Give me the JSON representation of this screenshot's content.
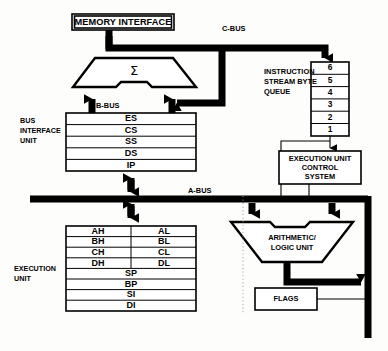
{
  "diagram": {
    "background_color": "#fdfdfb",
    "line_color": "#000000"
  },
  "blocks": {
    "memory_interface": {
      "label": "MEMORY INTERFACE"
    },
    "adder": {
      "label": "Σ",
      "name": "address-adder"
    },
    "instruction_queue": {
      "label_line1": "INSTRUCTION",
      "label_line2": "STREAM BYTE",
      "label_line3": "QUEUE",
      "cells": [
        "6",
        "5",
        "4",
        "3",
        "2",
        "1"
      ]
    },
    "execution_control": {
      "label_line1": "EXECUTION UNIT",
      "label_line2": "CONTROL",
      "label_line3": "SYSTEM"
    },
    "alu": {
      "label_line1": "ARITHMETIC/",
      "label_line2": "LOGIC UNIT"
    },
    "flags": {
      "label": "FLAGS"
    }
  },
  "units": {
    "bus_interface_unit": {
      "label_line1": "BUS",
      "label_line2": "INTERFACE",
      "label_line3": "UNIT"
    },
    "execution_unit": {
      "label_line1": "EXECUTION",
      "label_line2": "UNIT"
    }
  },
  "buses": {
    "a_bus": "A-BUS",
    "b_bus": "B-BUS",
    "c_bus": "C-BUS"
  },
  "registers": {
    "bus_interface_registers": [
      "ES",
      "CS",
      "SS",
      "DS",
      "IP"
    ],
    "execution_unit_registers": {
      "paired": [
        {
          "high": "AH",
          "low": "AL"
        },
        {
          "high": "BH",
          "low": "BL"
        },
        {
          "high": "CH",
          "low": "CL"
        },
        {
          "high": "DH",
          "low": "DL"
        }
      ],
      "wide": [
        "SP",
        "BP",
        "SI",
        "DI"
      ]
    }
  }
}
